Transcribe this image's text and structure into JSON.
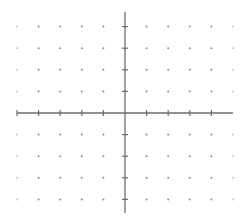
{
  "diagram": {
    "type": "coordinate-grid",
    "x_range": [
      -5,
      5
    ],
    "y_range": [
      -4,
      4
    ],
    "grid_style": "dots",
    "x_axis": {
      "ticks": [
        -5,
        -4,
        -3,
        -2,
        -1,
        1,
        2,
        3,
        4
      ],
      "labels_shown": false
    },
    "y_axis": {
      "ticks": [
        -4,
        -3,
        -2,
        -1,
        1,
        2,
        3,
        4
      ],
      "labels_shown": false
    },
    "colors": {
      "axis": "#6e6e6e",
      "dot": "#8a8a8a",
      "dot_faint": "#c8c8c8",
      "background": "#ffffff"
    },
    "geometry": {
      "origin_px": [
        125,
        113
      ],
      "unit_px": 21.6,
      "x_axis_px": [
        17,
        233
      ],
      "y_axis_px": [
        12,
        213
      ]
    }
  }
}
